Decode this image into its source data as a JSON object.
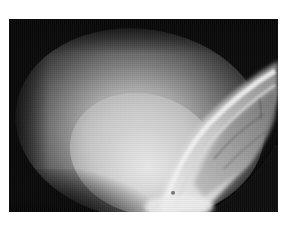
{
  "image": {
    "description": "Grayscale photograph showing a bright illuminated oval field with a curved banded tissue-like structure on the right side",
    "colors": {
      "background": "#ffffff",
      "frame": "#0b0b0b",
      "highlight": "#e8e8e8",
      "midtone": "#9a9a9a"
    }
  }
}
